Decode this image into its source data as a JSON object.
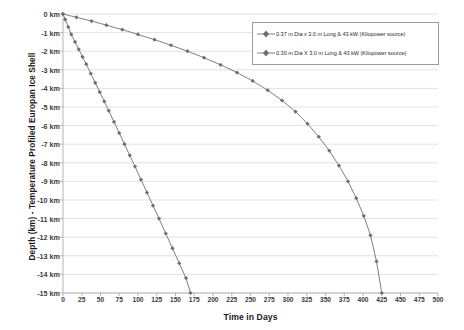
{
  "chart_data": {
    "type": "line",
    "title": "",
    "xlabel": "Time in Days",
    "ylabel": "Depth (km) - Temperature Profiled Europan Ice Shell",
    "xlim": [
      0,
      500
    ],
    "ylim": [
      -15,
      0
    ],
    "xticks": [
      0,
      25,
      50,
      75,
      100,
      125,
      150,
      175,
      200,
      225,
      250,
      275,
      300,
      325,
      350,
      375,
      400,
      425,
      450,
      475,
      500
    ],
    "xtick_labels": [
      "0",
      "25",
      "50",
      "75",
      "100",
      "125",
      "150",
      "175",
      "200",
      "225",
      "250",
      "275",
      "300",
      "325",
      "350",
      "375",
      "400",
      "425",
      "450",
      "475",
      "500"
    ],
    "yticks": [
      0,
      -1,
      -2,
      -3,
      -4,
      -5,
      -6,
      -7,
      -8,
      -9,
      -10,
      -11,
      -12,
      -13,
      -14,
      -15
    ],
    "ytick_labels": [
      "0 km",
      "-1 km",
      "-2 km",
      "-3 km",
      "-4 km",
      "-5 km",
      "-6 km",
      "-7 km",
      "-8 km",
      "-9 km",
      "-10 km",
      "-11 km",
      "-12 km",
      "-13 km",
      "-14 km",
      "-15 km"
    ],
    "grid": "horizontal",
    "legend_position": "top-right",
    "series": [
      {
        "name": "0.37 m Dia x 3.0 m Long & 43 kW (Kilopower source)",
        "color": "#808080",
        "marker": "diamond",
        "x": [
          0,
          3,
          7,
          11,
          16,
          21,
          26,
          31,
          37,
          43,
          49,
          55,
          61,
          68,
          75,
          82,
          89,
          96,
          104,
          112,
          120,
          128,
          137,
          146,
          155,
          164,
          170
        ],
        "y": [
          0,
          -0.3,
          -0.7,
          -1.1,
          -1.5,
          -1.9,
          -2.3,
          -2.7,
          -3.2,
          -3.7,
          -4.2,
          -4.7,
          -5.2,
          -5.8,
          -6.4,
          -7.0,
          -7.6,
          -8.2,
          -8.9,
          -9.6,
          -10.3,
          -11.0,
          -11.8,
          -12.6,
          -13.4,
          -14.2,
          -15.0
        ]
      },
      {
        "name": "0.30 m Dia X 3.0 m Long & 43 kW (Kilopower source)",
        "color": "#808080",
        "marker": "diamond",
        "x": [
          0,
          18,
          38,
          58,
          79,
          100,
          122,
          144,
          166,
          188,
          210,
          232,
          253,
          273,
          292,
          310,
          326,
          341,
          355,
          368,
          380,
          391,
          401,
          410,
          418,
          425
        ],
        "y": [
          0,
          -0.18,
          -0.38,
          -0.6,
          -0.84,
          -1.1,
          -1.38,
          -1.68,
          -2.0,
          -2.35,
          -2.73,
          -3.15,
          -3.6,
          -4.1,
          -4.65,
          -5.25,
          -5.9,
          -6.6,
          -7.35,
          -8.15,
          -9.0,
          -9.9,
          -10.85,
          -11.9,
          -13.3,
          -15.0
        ]
      }
    ]
  }
}
